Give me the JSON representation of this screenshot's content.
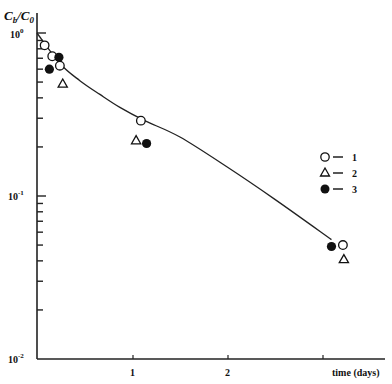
{
  "chart_data": {
    "type": "scatter",
    "title": "",
    "ylabel": "Cb/C0",
    "ylabel_main": "C",
    "ylabel_sub1": "b",
    "ylabel_slash": "/C",
    "ylabel_sub2": "0",
    "xlabel": "time (days)",
    "yscale": "log",
    "ylim": [
      0.01,
      1.0
    ],
    "xlim": [
      0,
      3.4
    ],
    "y_ticks": [
      {
        "base": "10",
        "exp": "0",
        "value": 1.0
      },
      {
        "base": "10",
        "exp": "-1",
        "value": 0.1
      },
      {
        "base": "10",
        "exp": "-2",
        "value": 0.01
      }
    ],
    "x_ticks": [
      {
        "label": "1",
        "value": 1
      },
      {
        "label": "2",
        "value": 2
      },
      {
        "label": "",
        "value": 3
      }
    ],
    "grid": false,
    "legend_position": "right-middle",
    "series": [
      {
        "name": "1",
        "marker": "open-circle",
        "points": [
          [
            0.08,
            0.84
          ],
          [
            0.16,
            0.72
          ],
          [
            0.24,
            0.63
          ],
          [
            1.09,
            0.29
          ],
          [
            3.21,
            0.05
          ]
        ]
      },
      {
        "name": "2",
        "marker": "open-triangle",
        "points": [
          [
            0.27,
            0.49
          ],
          [
            1.04,
            0.22
          ],
          [
            3.22,
            0.041
          ]
        ]
      },
      {
        "name": "3",
        "marker": "filled-circle",
        "points": [
          [
            0.13,
            0.6
          ],
          [
            0.23,
            0.71
          ],
          [
            1.15,
            0.21
          ],
          [
            3.09,
            0.049
          ]
        ]
      }
    ],
    "fit_curve": {
      "name": "fitted decay curve",
      "points": [
        [
          0.0,
          1.0
        ],
        [
          0.24,
          0.65
        ],
        [
          0.45,
          0.51
        ],
        [
          0.66,
          0.42
        ],
        [
          0.87,
          0.35
        ],
        [
          1.13,
          0.29
        ],
        [
          1.5,
          0.23
        ],
        [
          2.0,
          0.15
        ],
        [
          2.5,
          0.095
        ],
        [
          3.09,
          0.054
        ]
      ]
    },
    "legend": [
      {
        "marker": "open-circle",
        "dash": "—",
        "label": "1"
      },
      {
        "marker": "open-triangle",
        "dash": "—",
        "label": "2"
      },
      {
        "marker": "filled-circle",
        "dash": "—",
        "label": "3"
      }
    ]
  }
}
